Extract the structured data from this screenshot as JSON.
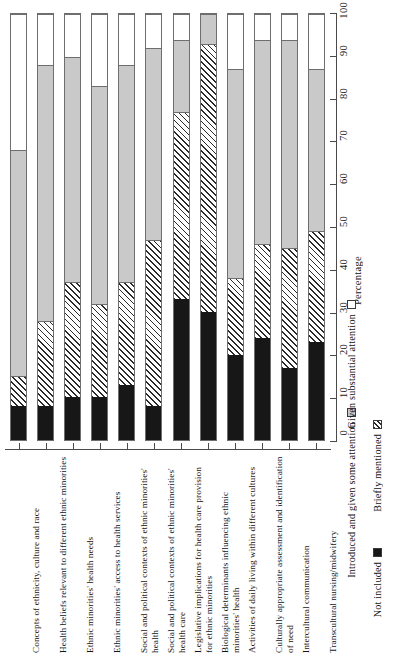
{
  "chart_data": {
    "type": "bar",
    "orientation": "vertical-stacked-percent",
    "title": "",
    "xlabel": "",
    "ylabel": "Percentage",
    "ylim": [
      0,
      100
    ],
    "yticks": [
      0,
      10,
      20,
      30,
      40,
      50,
      60,
      70,
      80,
      90,
      100
    ],
    "grid": false,
    "legend_position": "bottom-right",
    "stacking": "percent",
    "categories": [
      "Concepts of ethnicity, culture and race",
      "Health beliefs relevant to different ethnic minorities",
      "Ethnic minorities' health needs",
      "Ethnic minorities' access to health services",
      "Social and political contexts of ethnic minorities' health",
      "Social and political contexts of ethnic minorities' health care",
      "Legislative implications for health care provision for ethnic minorities",
      "Biological determinants influencing ethnic minorities' health",
      "Activities of daily living within different cultures",
      "Culturally appropriate assessment and identification of need",
      "Intercultural communication",
      "Transcultural nursing/midwifery"
    ],
    "series": [
      {
        "name": "Not included",
        "color": "#171717",
        "pattern": "solid",
        "values": [
          8,
          8,
          10,
          10,
          13,
          8,
          33,
          30,
          20,
          24,
          17,
          23
        ]
      },
      {
        "name": "Briefly mentioned",
        "color": "#ffffff",
        "pattern": "hatch",
        "values": [
          7,
          20,
          27,
          22,
          24,
          39,
          44,
          63,
          18,
          22,
          28,
          26
        ]
      },
      {
        "name": "Introduced and given some attention",
        "color": "#c9c9c9",
        "pattern": "solid",
        "values": [
          53,
          60,
          53,
          51,
          51,
          45,
          17,
          7,
          49,
          48,
          49,
          38
        ]
      },
      {
        "name": "Given substantial attention",
        "color": "#ffffff",
        "pattern": "solid",
        "values": [
          32,
          12,
          10,
          17,
          12,
          8,
          6,
          0,
          13,
          6,
          6,
          13
        ]
      }
    ]
  },
  "legend": {
    "items": [
      {
        "label": "Not included",
        "swatch": "black"
      },
      {
        "label": "Briefly mentioned",
        "swatch": "hatch"
      },
      {
        "label": "Introduced and given some attention",
        "swatch": "gray"
      },
      {
        "label": "Given substantial attention",
        "swatch": "white"
      }
    ]
  },
  "axis": {
    "y_title": "Percentage"
  }
}
